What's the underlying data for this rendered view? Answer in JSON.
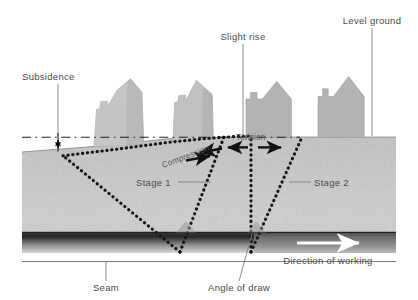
{
  "figure": {
    "width": 418,
    "height": 300
  },
  "labels": {
    "subsidence": "Subsidence",
    "slight_rise": "Slight rise",
    "level_ground": "Level ground",
    "compression": "Compression",
    "tension": "Tension",
    "stage_1": "Stage 1",
    "stage_2": "Stage 2",
    "seam": "Seam",
    "angle_of_draw": "Angle of draw",
    "direction_of_working": "Direction of working"
  },
  "colors": {
    "text": "#4a4a4a",
    "leader": "#808080",
    "house_fill": "#b3b3b3",
    "house_fill_light": "#c4c4c4",
    "ground_top": "#9d9d9d",
    "ground_bottom": "#e3e3e3",
    "seam_dark": "#2b2b2b",
    "seam_light": "#8f8f8f",
    "dotted": "#1a1a1a",
    "arrow": "#111111",
    "white": "#ffffff"
  },
  "geometry": {
    "ground_surface_y": 137,
    "ground_bottom_y": 232,
    "seam_top_y": 232,
    "seam_bottom_y": 253,
    "base_line_y": 262,
    "left_edge_x": 22,
    "right_edge_x": 396,
    "datum_line_y": 137,
    "subsidence_marker_x": 58,
    "subsided_surface_left_y": 152,
    "stage1_face_x": 180,
    "stage2_face_x": 250,
    "slight_rise_x": 243,
    "level_ground_x": 372
  },
  "icons": {
    "arrow_right": "arrow-right-icon",
    "arrow_left": "arrow-left-icon",
    "direction_arrow": "direction-arrow-icon"
  }
}
